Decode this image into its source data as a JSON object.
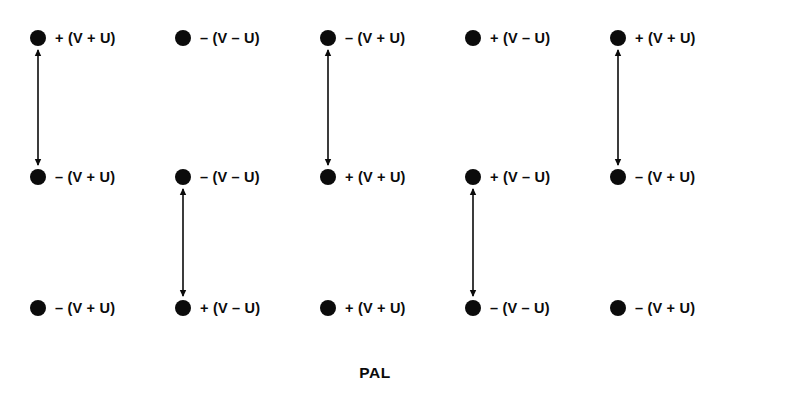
{
  "figure": {
    "caption": "PAL",
    "background_color": "#ffffff",
    "ink_color": "#0b0b0b",
    "columns": 5,
    "rows": 3
  },
  "layout": {
    "column_x": [
      30,
      175,
      320,
      465,
      610
    ],
    "row_y": [
      38,
      177,
      308
    ],
    "dot_diameter": 16,
    "caption_x": 375,
    "caption_y": 364
  },
  "columns": [
    {
      "index": 1,
      "nodes": [
        {
          "row": 1,
          "label": "+ (V + U)",
          "sign": "+",
          "expression": "(V + U)"
        },
        {
          "row": 2,
          "label": "– (V + U)",
          "sign": "–",
          "expression": "(V + U)"
        },
        {
          "row": 3,
          "label": "– (V + U)",
          "sign": "–",
          "expression": "(V + U)"
        }
      ],
      "arrow": {
        "from_row": 1,
        "to_row": 2,
        "double_headed": true
      }
    },
    {
      "index": 2,
      "nodes": [
        {
          "row": 1,
          "label": "– (V – U)",
          "sign": "–",
          "expression": "(V – U)"
        },
        {
          "row": 2,
          "label": "– (V – U)",
          "sign": "–",
          "expression": "(V – U)"
        },
        {
          "row": 3,
          "label": "+ (V – U)",
          "sign": "+",
          "expression": "(V – U)"
        }
      ],
      "arrow": {
        "from_row": 2,
        "to_row": 3,
        "double_headed": true
      }
    },
    {
      "index": 3,
      "nodes": [
        {
          "row": 1,
          "label": "– (V + U)",
          "sign": "–",
          "expression": "(V + U)"
        },
        {
          "row": 2,
          "label": "+ (V + U)",
          "sign": "+",
          "expression": "(V + U)"
        },
        {
          "row": 3,
          "label": "+ (V + U)",
          "sign": "+",
          "expression": "(V + U)"
        }
      ],
      "arrow": {
        "from_row": 1,
        "to_row": 2,
        "double_headed": true
      }
    },
    {
      "index": 4,
      "nodes": [
        {
          "row": 1,
          "label": "+ (V – U)",
          "sign": "+",
          "expression": "(V – U)"
        },
        {
          "row": 2,
          "label": "+ (V – U)",
          "sign": "+",
          "expression": "(V – U)"
        },
        {
          "row": 3,
          "label": "– (V – U)",
          "sign": "–",
          "expression": "(V – U)"
        }
      ],
      "arrow": {
        "from_row": 2,
        "to_row": 3,
        "double_headed": true
      }
    },
    {
      "index": 5,
      "nodes": [
        {
          "row": 1,
          "label": "+ (V + U)",
          "sign": "+",
          "expression": "(V + U)"
        },
        {
          "row": 2,
          "label": "– (V + U)",
          "sign": "–",
          "expression": "(V + U)"
        },
        {
          "row": 3,
          "label": "– (V + U)",
          "sign": "–",
          "expression": "(V + U)"
        }
      ],
      "arrow": {
        "from_row": 1,
        "to_row": 2,
        "double_headed": true
      }
    }
  ]
}
